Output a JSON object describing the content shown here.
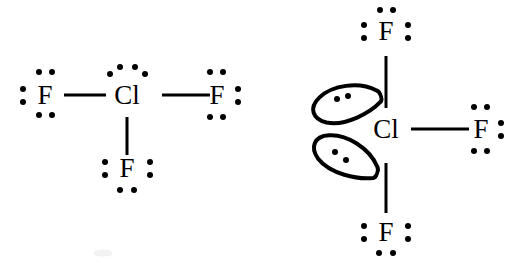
{
  "figure": {
    "background_color": "#ffffff",
    "ink_color": "#000000",
    "width": 509,
    "height": 269
  },
  "structures": [
    {
      "id": "left-structure",
      "name": "clf3-lewis-dot-structure",
      "description": "T-shaped ClF3 Lewis structure with lone pair dots on chlorine",
      "atoms": [
        {
          "id": "left-F-west",
          "label": "F",
          "x": 45,
          "y": 95
        },
        {
          "id": "left-Cl",
          "label": "Cl",
          "x": 127,
          "y": 95
        },
        {
          "id": "left-F-east",
          "label": "F",
          "x": 217,
          "y": 95
        },
        {
          "id": "left-F-south",
          "label": "F",
          "x": 127,
          "y": 168
        }
      ],
      "bonds": [
        {
          "id": "left-bond-west",
          "orientation": "h",
          "x": 85,
          "y": 95,
          "length": 42
        },
        {
          "id": "left-bond-east",
          "orientation": "h",
          "x": 186,
          "y": 95,
          "length": 48
        },
        {
          "id": "left-bond-south",
          "orientation": "v",
          "x": 127,
          "y": 136,
          "length": 38
        }
      ],
      "dots": [
        {
          "id": "left-F-west-top-1",
          "x": 39,
          "y": 72
        },
        {
          "id": "left-F-west-top-2",
          "x": 52,
          "y": 72
        },
        {
          "id": "left-F-west-left-1",
          "x": 23,
          "y": 89
        },
        {
          "id": "left-F-west-left-2",
          "x": 23,
          "y": 102
        },
        {
          "id": "left-F-west-bottom-1",
          "x": 39,
          "y": 115
        },
        {
          "id": "left-F-west-bottom-2",
          "x": 52,
          "y": 115
        },
        {
          "id": "left-Cl-lp1-a",
          "x": 110,
          "y": 74
        },
        {
          "id": "left-Cl-lp1-b",
          "x": 120,
          "y": 67
        },
        {
          "id": "left-Cl-lp2-a",
          "x": 135,
          "y": 67
        },
        {
          "id": "left-Cl-lp2-b",
          "x": 145,
          "y": 74
        },
        {
          "id": "left-F-east-top-1",
          "x": 210,
          "y": 72
        },
        {
          "id": "left-F-east-top-2",
          "x": 223,
          "y": 72
        },
        {
          "id": "left-F-east-right-1",
          "x": 238,
          "y": 89
        },
        {
          "id": "left-F-east-right-2",
          "x": 238,
          "y": 102
        },
        {
          "id": "left-F-east-bottom-1",
          "x": 210,
          "y": 117
        },
        {
          "id": "left-F-east-bottom-2",
          "x": 223,
          "y": 117
        },
        {
          "id": "left-F-south-left-1",
          "x": 105,
          "y": 162
        },
        {
          "id": "left-F-south-left-2",
          "x": 105,
          "y": 175
        },
        {
          "id": "left-F-south-right-1",
          "x": 150,
          "y": 162
        },
        {
          "id": "left-F-south-right-2",
          "x": 150,
          "y": 175
        },
        {
          "id": "left-F-south-bottom-1",
          "x": 120,
          "y": 190
        },
        {
          "id": "left-F-south-bottom-2",
          "x": 134,
          "y": 190
        }
      ],
      "lobes": []
    },
    {
      "id": "right-structure",
      "name": "clf3-orbital-lobe-structure",
      "description": "T-shaped ClF3 with equatorial lone pairs drawn as orbital lobes",
      "atoms": [
        {
          "id": "right-F-north",
          "label": "F",
          "x": 386,
          "y": 31
        },
        {
          "id": "right-Cl",
          "label": "Cl",
          "x": 386,
          "y": 129
        },
        {
          "id": "right-F-east",
          "label": "F",
          "x": 481,
          "y": 129
        },
        {
          "id": "right-F-south",
          "label": "F",
          "x": 386,
          "y": 232
        }
      ],
      "bonds": [
        {
          "id": "right-bond-north",
          "orientation": "v",
          "x": 386,
          "y": 82,
          "length": 52
        },
        {
          "id": "right-bond-east",
          "orientation": "h",
          "x": 440,
          "y": 129,
          "length": 58
        },
        {
          "id": "right-bond-south",
          "orientation": "v",
          "x": 386,
          "y": 188,
          "length": 50
        }
      ],
      "dots": [
        {
          "id": "right-F-north-top-1",
          "x": 380,
          "y": 10
        },
        {
          "id": "right-F-north-top-2",
          "x": 393,
          "y": 10
        },
        {
          "id": "right-F-north-left-1",
          "x": 364,
          "y": 25
        },
        {
          "id": "right-F-north-left-2",
          "x": 364,
          "y": 38
        },
        {
          "id": "right-F-north-right-1",
          "x": 408,
          "y": 25
        },
        {
          "id": "right-F-north-right-2",
          "x": 408,
          "y": 38
        },
        {
          "id": "right-F-east-top-1",
          "x": 474,
          "y": 107
        },
        {
          "id": "right-F-east-top-2",
          "x": 487,
          "y": 107
        },
        {
          "id": "right-F-east-right-1",
          "x": 501,
          "y": 123
        },
        {
          "id": "right-F-east-right-2",
          "x": 501,
          "y": 136
        },
        {
          "id": "right-F-east-bottom-1",
          "x": 474,
          "y": 151
        },
        {
          "id": "right-F-east-bottom-2",
          "x": 487,
          "y": 151
        },
        {
          "id": "right-F-south-left-1",
          "x": 364,
          "y": 226
        },
        {
          "id": "right-F-south-left-2",
          "x": 364,
          "y": 239
        },
        {
          "id": "right-F-south-right-1",
          "x": 408,
          "y": 226
        },
        {
          "id": "right-F-south-right-2",
          "x": 408,
          "y": 239
        },
        {
          "id": "right-F-south-bottom-1",
          "x": 379,
          "y": 253
        },
        {
          "id": "right-F-south-bottom-2",
          "x": 393,
          "y": 253
        }
      ],
      "lobes": [
        {
          "id": "right-lobe-upper",
          "name": "lone-pair-lobe-upper",
          "x": 345,
          "y": 103,
          "rotation": -20,
          "dots": [
            {
              "x": 337,
              "y": 99
            },
            {
              "x": 348,
              "y": 96
            }
          ]
        },
        {
          "id": "right-lobe-lower",
          "name": "lone-pair-lobe-lower",
          "x": 345,
          "y": 156,
          "rotation": 20,
          "dots": [
            {
              "x": 335,
              "y": 152
            },
            {
              "x": 346,
              "y": 160
            }
          ]
        }
      ]
    }
  ],
  "artifacts": [
    {
      "id": "scan-smudge",
      "x": 103,
      "y": 253,
      "width": 18,
      "height": 7
    }
  ]
}
